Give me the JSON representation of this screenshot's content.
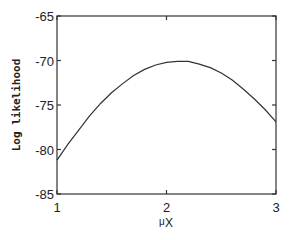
{
  "chart_data": {
    "type": "line",
    "title": "",
    "xlabel": "μ",
    "xlabel_subscript": "X",
    "ylabel": "Log likelihood",
    "xlim": [
      1,
      3
    ],
    "ylim": [
      -85,
      -65
    ],
    "xticks": [
      1,
      2,
      3
    ],
    "xtick_labels": [
      "1",
      "2",
      "3"
    ],
    "yticks": [
      -65,
      -70,
      -75,
      -80,
      -85
    ],
    "ytick_labels": [
      "-65",
      "-70",
      "-75",
      "-80",
      "-85"
    ],
    "grid": false,
    "series": [
      {
        "name": "log-likelihood",
        "x": [
          1.0,
          1.1,
          1.2,
          1.3,
          1.4,
          1.5,
          1.6,
          1.7,
          1.8,
          1.9,
          2.0,
          2.1,
          2.15,
          2.2,
          2.3,
          2.4,
          2.5,
          2.6,
          2.7,
          2.8,
          2.9,
          3.0
        ],
        "y": [
          -81.2,
          -79.4,
          -77.8,
          -76.2,
          -74.8,
          -73.6,
          -72.6,
          -71.7,
          -71.0,
          -70.5,
          -70.2,
          -70.1,
          -70.1,
          -70.1,
          -70.4,
          -70.8,
          -71.4,
          -72.2,
          -73.2,
          -74.3,
          -75.5,
          -76.9
        ]
      }
    ]
  }
}
